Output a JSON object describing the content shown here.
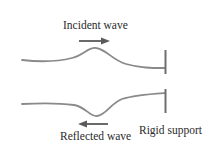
{
  "diagram": {
    "labels": {
      "incident": "Incident wave",
      "reflected": "Reflected wave",
      "support": "Rigid support"
    },
    "colors": {
      "wave": "#8a8a8a",
      "arrow": "#5a5a5a",
      "support": "#6e6e6e",
      "text": "#2a2a2a"
    },
    "elements": [
      {
        "name": "incident-wave-pulse",
        "shape": "upward pulse",
        "direction": "right"
      },
      {
        "name": "reflected-wave-pulse",
        "shape": "inverted pulse",
        "direction": "left"
      },
      {
        "name": "rigid-support",
        "count": 2
      }
    ]
  }
}
